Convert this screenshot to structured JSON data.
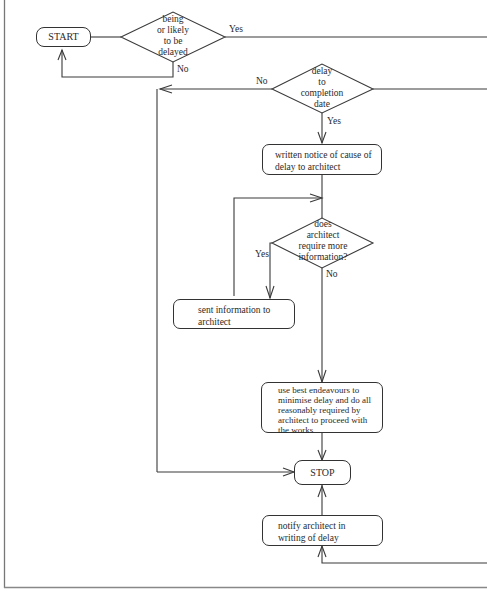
{
  "diagram": {
    "type": "flowchart",
    "nodes": {
      "start": {
        "label": "START",
        "shape": "terminator"
      },
      "decision_delayed": {
        "label_lines": [
          "being",
          "or likely",
          "to be",
          "delayed"
        ],
        "shape": "decision"
      },
      "decision_delay_completion": {
        "label_lines": [
          "delay",
          "to",
          "completion",
          "date"
        ],
        "shape": "decision"
      },
      "written_notice": {
        "label": "written notice of cause of delay to architect",
        "shape": "process"
      },
      "decision_more_info": {
        "label_lines": [
          "does",
          "architect",
          "require more",
          "information?"
        ],
        "shape": "decision"
      },
      "sent_info": {
        "label": "sent information to architect",
        "shape": "process"
      },
      "best_endeavours": {
        "label": "use best endeavours to minimise delay and do all reasonably required by architect to proceed with the works",
        "shape": "process"
      },
      "stop": {
        "label": "STOP",
        "shape": "terminator"
      },
      "notify_architect": {
        "label": "notify architect in writing of delay",
        "shape": "process"
      }
    },
    "edge_labels": {
      "delayed_yes": "Yes",
      "delayed_no": "No",
      "completion_no": "No",
      "completion_yes": "Yes",
      "more_info_yes": "Yes",
      "more_info_no": "No"
    },
    "edges": [
      {
        "from": "start",
        "to": "decision_delayed"
      },
      {
        "from": "decision_delayed",
        "to": "start",
        "label": "No"
      },
      {
        "from": "decision_delayed",
        "to": "offpage-right",
        "label": "Yes"
      },
      {
        "from": "decision_delay_completion",
        "to": "stop",
        "label": "No"
      },
      {
        "from": "decision_delay_completion",
        "to": "written_notice",
        "label": "Yes"
      },
      {
        "from": "decision_delay_completion",
        "to": "offpage-right"
      },
      {
        "from": "written_notice",
        "to": "decision_more_info"
      },
      {
        "from": "decision_more_info",
        "to": "sent_info",
        "label": "Yes"
      },
      {
        "from": "sent_info",
        "to": "decision_more_info"
      },
      {
        "from": "decision_more_info",
        "to": "best_endeavours",
        "label": "No"
      },
      {
        "from": "best_endeavours",
        "to": "stop"
      },
      {
        "from": "notify_architect",
        "to": "stop"
      },
      {
        "from": "offpage-right",
        "to": "notify_architect"
      }
    ]
  }
}
